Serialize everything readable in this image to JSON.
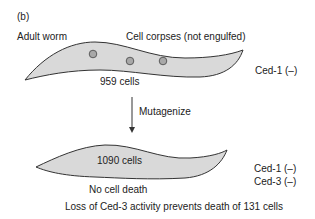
{
  "panel_label": "(b)",
  "top_worm": {
    "label": "Adult worm",
    "corpse_label": "Cell corpses (not engulfed)",
    "cell_count": "959 cells",
    "genotype": [
      "Ced-1 (–)"
    ],
    "corpse_count": 3
  },
  "arrow": {
    "label": "Mutagenize"
  },
  "bottom_worm": {
    "cell_count": "1090 cells",
    "genotype": [
      "Ced-1 (–)",
      "Ced-3 (–)"
    ],
    "note": "No cell death",
    "caption": "Loss of Ced-3 activity prevents death of 131 cells"
  },
  "colors": {
    "worm_fill": "#d9d9d9",
    "worm_stroke": "#333333",
    "corpse_fill": "#a8a8a8",
    "text": "#222222"
  }
}
